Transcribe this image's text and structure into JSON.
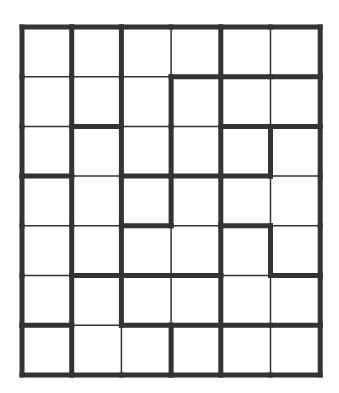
{
  "puzzle": {
    "type": "region-partition-grid",
    "rows": 7,
    "cols": 6,
    "origin": [
      22,
      27
    ],
    "cell_size": 49.7,
    "line_color": "#333333",
    "thick_width": 5,
    "thin_width": 1.5,
    "horizontal_edges": [
      [
        1,
        1,
        1,
        1,
        1,
        1
      ],
      [
        0,
        0,
        0,
        1,
        1,
        1
      ],
      [
        0,
        1,
        0,
        0,
        1,
        1
      ],
      [
        1,
        0,
        1,
        1,
        1,
        0
      ],
      [
        0,
        0,
        1,
        0,
        1,
        0
      ],
      [
        0,
        1,
        1,
        1,
        0,
        1
      ],
      [
        1,
        0,
        1,
        1,
        1,
        1
      ],
      [
        1,
        1,
        1,
        1,
        1,
        1
      ]
    ],
    "vertical_edges": [
      [
        1,
        1,
        1,
        0,
        1,
        0,
        1
      ],
      [
        1,
        1,
        1,
        1,
        1,
        0,
        1
      ],
      [
        1,
        1,
        1,
        1,
        1,
        1,
        1
      ],
      [
        1,
        1,
        1,
        1,
        1,
        0,
        1
      ],
      [
        1,
        1,
        1,
        0,
        1,
        1,
        1
      ],
      [
        1,
        1,
        1,
        0,
        1,
        0,
        1
      ],
      [
        1,
        1,
        0,
        1,
        1,
        0,
        1
      ]
    ]
  }
}
